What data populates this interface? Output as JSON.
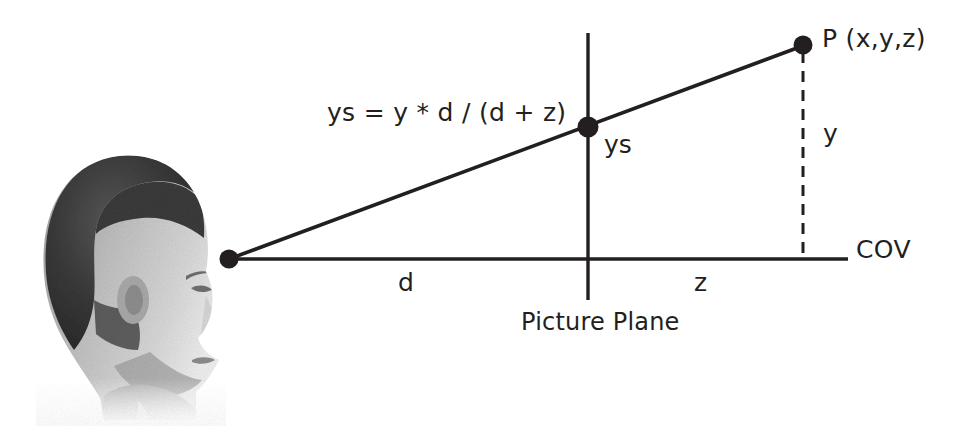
{
  "diagram": {
    "background_color": "#ffffff",
    "ink_color": "#231f20",
    "labels": {
      "formula": "ys = y * d / (d + z)",
      "point_p": "P (x,y,z)",
      "projected_point": "ys",
      "height_y": "y",
      "distance_d": "d",
      "depth_z": "z",
      "center_of_view": "COV",
      "picture_plane": "Picture Plane"
    },
    "geometry": {
      "eye_point": {
        "x": 229,
        "y": 259,
        "radius": 9
      },
      "point_p": {
        "x": 803,
        "y": 45,
        "radius": 9
      },
      "intersection_point": {
        "x": 588,
        "y": 127,
        "radius": 10
      },
      "axis_line": {
        "x1": 229,
        "y1": 259,
        "x2": 848,
        "y2": 259
      },
      "picture_plane_line": {
        "x": 588,
        "y1": 33,
        "y2": 300
      },
      "projector_ray": {
        "x1": 229,
        "y1": 259,
        "x2": 805,
        "y2": 45
      },
      "dashed_drop_line": {
        "x": 803,
        "y1": 52,
        "y2": 259
      }
    },
    "image": {
      "subject": "head-profile-photo",
      "description": "grayscale photograph of a man's head in profile facing right",
      "bounds": {
        "x": 36,
        "y": 152,
        "width": 190,
        "height": 272
      }
    }
  }
}
